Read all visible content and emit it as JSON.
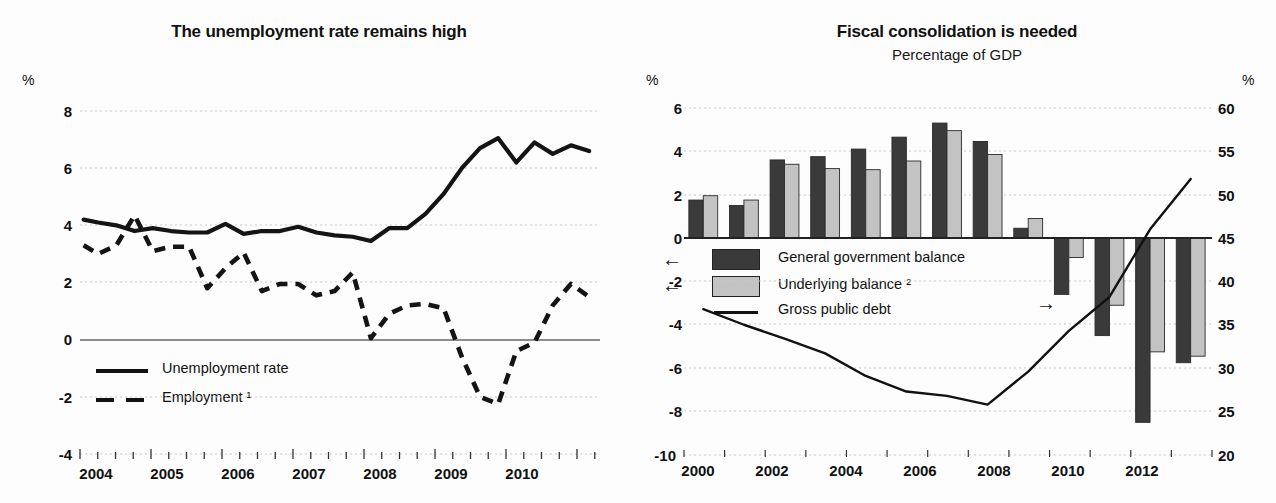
{
  "charts": [
    {
      "id": "unemployment",
      "title": "The unemployment rate remains high",
      "subtitle": "",
      "unit_label": "%",
      "axis": {
        "y_ticks": [
          "8",
          "6",
          "4",
          "2",
          "0",
          "-2",
          "-4"
        ],
        "x_ticks": [
          "2004",
          "2005",
          "2006",
          "2007",
          "2008",
          "2009",
          "2010"
        ]
      },
      "legend": [
        {
          "label": "Unemployment rate",
          "style": "solid"
        },
        {
          "label": "Employment ¹",
          "style": "dashed"
        }
      ]
    },
    {
      "id": "fiscal",
      "title": "Fiscal consolidation is needed",
      "subtitle": "Percentage of GDP",
      "unit_label_left": "%",
      "unit_label_right": "%",
      "axis": {
        "y_ticks_left": [
          "6",
          "4",
          "2",
          "0",
          "-2",
          "-4",
          "-6",
          "-8",
          "-10"
        ],
        "y_ticks_right": [
          "60",
          "55",
          "50",
          "45",
          "40",
          "35",
          "30",
          "25",
          "20"
        ],
        "x_ticks": [
          "2000",
          "2002",
          "2004",
          "2006",
          "2008",
          "2010",
          "2012"
        ]
      },
      "legend": [
        {
          "label": "General government balance",
          "style": "bar-dark",
          "axis_arrow": "←"
        },
        {
          "label": "Underlying balance ²",
          "style": "bar-light",
          "axis_arrow": "←"
        },
        {
          "label": "Gross public debt",
          "style": "line",
          "axis_arrow": "→"
        }
      ]
    }
  ],
  "colors": {
    "bar_dark": "#3a3a3a",
    "bar_light": "#c3c3c3",
    "line": "#111111",
    "grid": "#c8c8c8",
    "axis": "#555555"
  },
  "chart_data": [
    {
      "type": "line",
      "id": "unemployment",
      "title": "The unemployment rate remains high",
      "xlabel": "",
      "ylabel": "%",
      "ylim": [
        -4,
        8
      ],
      "xlim": [
        2003.75,
        2010.9
      ],
      "grid": true,
      "legend_position": "inside-lower-left",
      "x": [
        2003.8,
        2004.0,
        2004.25,
        2004.5,
        2004.75,
        2005.0,
        2005.25,
        2005.5,
        2005.75,
        2006.0,
        2006.25,
        2006.5,
        2006.75,
        2007.0,
        2007.25,
        2007.5,
        2007.75,
        2008.0,
        2008.25,
        2008.5,
        2008.75,
        2009.0,
        2009.25,
        2009.5,
        2009.75,
        2010.0,
        2010.25,
        2010.5,
        2010.75
      ],
      "series": [
        {
          "name": "Unemployment rate",
          "style": "solid",
          "values": [
            4.2,
            4.1,
            4.0,
            3.8,
            3.9,
            3.8,
            3.75,
            3.75,
            4.05,
            3.7,
            3.8,
            3.8,
            3.95,
            3.75,
            3.65,
            3.6,
            3.45,
            3.9,
            3.9,
            4.4,
            5.1,
            6.0,
            6.7,
            7.05,
            6.2,
            6.9,
            6.5,
            6.8,
            6.6
          ]
        },
        {
          "name": "Employment ¹",
          "style": "dashed",
          "values": [
            3.3,
            3.0,
            3.3,
            4.35,
            3.1,
            3.25,
            3.25,
            1.8,
            2.5,
            3.05,
            1.7,
            1.95,
            1.95,
            1.55,
            1.7,
            2.35,
            0.05,
            0.9,
            1.2,
            1.25,
            1.1,
            -0.6,
            -2.0,
            -2.25,
            -0.4,
            -0.1,
            1.2,
            1.95,
            1.5,
            1.85
          ]
        }
      ]
    },
    {
      "type": "bar",
      "id": "fiscal",
      "title": "Fiscal consolidation is needed",
      "subtitle": "Percentage of GDP",
      "xlabel": "",
      "ylabel_left": "%",
      "ylabel_right": "%",
      "ylim_left": [
        -10,
        6
      ],
      "ylim_right": [
        20,
        60
      ],
      "grid": true,
      "legend_position": "inside-left",
      "categories": [
        "2000",
        "2001",
        "2002",
        "2003",
        "2004",
        "2005",
        "2006",
        "2007",
        "2008",
        "2009",
        "2010",
        "2011",
        "2012"
      ],
      "series": [
        {
          "name": "General government balance",
          "axis": "left",
          "type": "bar",
          "values": [
            1.75,
            1.5,
            3.6,
            3.75,
            4.1,
            4.65,
            5.3,
            4.45,
            0.45,
            -2.6,
            -4.5,
            -8.5,
            -5.75
          ]
        },
        {
          "name": "Underlying balance ²",
          "axis": "left",
          "type": "bar",
          "values": [
            1.95,
            1.75,
            3.4,
            3.2,
            3.15,
            3.55,
            4.95,
            3.85,
            0.9,
            -0.9,
            -3.1,
            -5.25,
            -5.45
          ]
        },
        {
          "name": "Gross public debt",
          "axis": "right",
          "type": "line",
          "values": [
            36.8,
            35.0,
            33.4,
            31.7,
            29.1,
            27.3,
            26.8,
            25.8,
            29.6,
            34.3,
            38.2,
            46.0,
            51.8
          ]
        }
      ]
    }
  ]
}
